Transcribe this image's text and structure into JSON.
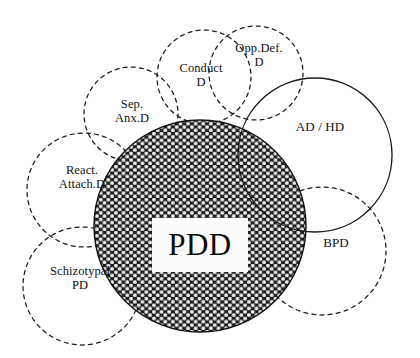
{
  "diagram": {
    "type": "venn-overlap-diagram",
    "width": 420,
    "height": 358,
    "background_color": "#ffffff",
    "stroke_color": "#1a1a1a",
    "center": {
      "name": "pdd-circle",
      "label": "PDD",
      "cx": 200,
      "cy": 226,
      "r": 106,
      "stroke_style": "solid",
      "fill": "hatched-dot-mesh",
      "label_box": {
        "x": 152,
        "y": 218,
        "width": 96,
        "height": 54,
        "fill": "#fbfbf9"
      }
    },
    "satellites": [
      {
        "name": "sep-anx-d-circle",
        "label": "Sep.\nAnx.D",
        "cx": 131,
        "cy": 114,
        "r": 47,
        "stroke_style": "dashed",
        "label_x": 131,
        "label_y": 105
      },
      {
        "name": "conduct-d-circle",
        "label": "Conduct\nD",
        "cx": 204,
        "cy": 77,
        "r": 47,
        "stroke_style": "dashed",
        "label_x": 200,
        "label_y": 68
      },
      {
        "name": "opp-def-d-circle",
        "label": "Opp.Def.\nD",
        "cx": 256,
        "cy": 73,
        "r": 47,
        "stroke_style": "dashed",
        "label_x": 258,
        "label_y": 50
      },
      {
        "name": "ad-hd-circle",
        "label": "AD / HD",
        "cx": 315,
        "cy": 155,
        "r": 77,
        "stroke_style": "solid",
        "label_x": 319,
        "label_y": 128
      },
      {
        "name": "bpd-circle",
        "label": "BPD",
        "cx": 322,
        "cy": 251,
        "r": 64,
        "stroke_style": "dashed",
        "label_x": 336,
        "label_y": 243
      },
      {
        "name": "schizotypal-pd-circle",
        "label": "Schizotypal\nPD",
        "cx": 82,
        "cy": 286,
        "r": 59,
        "stroke_style": "dashed",
        "label_x": 80,
        "label_y": 272
      },
      {
        "name": "react-attach-d-circle",
        "label": "React.\nAttach.D",
        "cx": 84,
        "cy": 190,
        "r": 57,
        "stroke_style": "dashed",
        "label_x": 82,
        "label_y": 171
      }
    ]
  }
}
